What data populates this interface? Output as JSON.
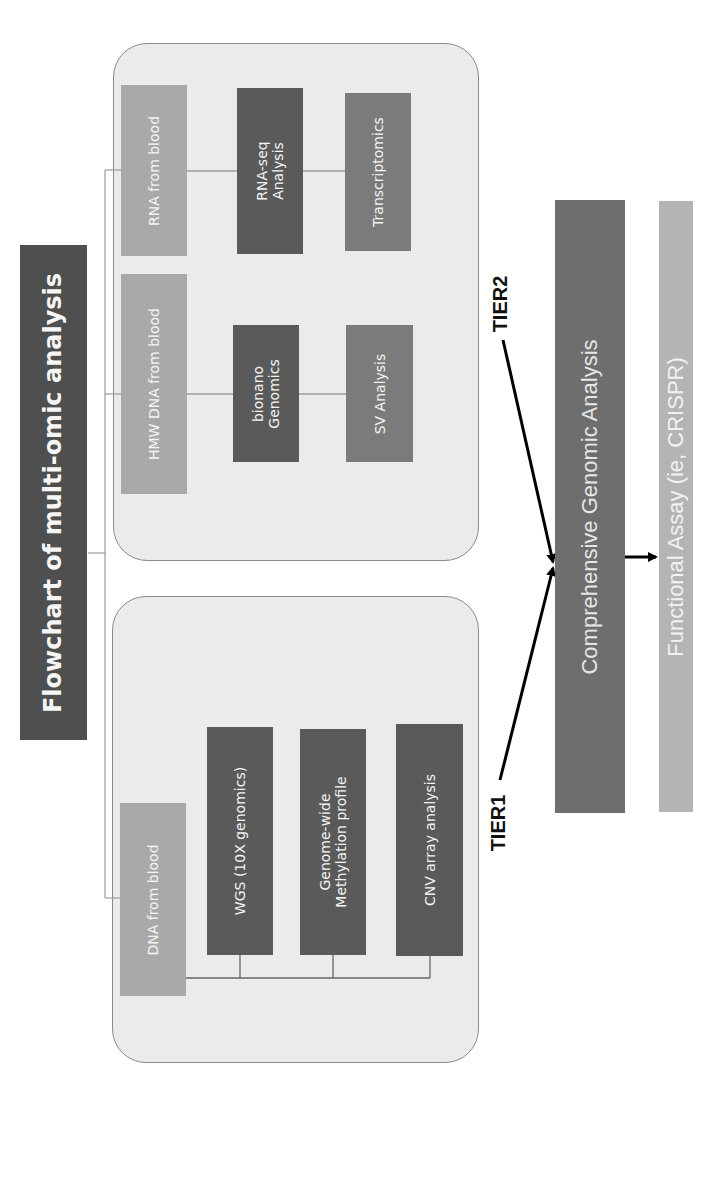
{
  "title": "Flowchart of multi-omic analysis",
  "tier2": {
    "label": "TIER2",
    "rows": [
      {
        "source": "RNA from blood",
        "steps": [
          "RNA-seq\nAnalysis",
          "Transcriptomics"
        ]
      },
      {
        "source": "HMW DNA from blood",
        "steps": [
          "bionano\nGenomics",
          "SV Analysis"
        ]
      }
    ]
  },
  "tier1": {
    "label": "TIER1",
    "source": "DNA from blood",
    "steps": [
      "WGS (10X genomics)",
      "Genome-wide\nMethylation profile",
      "CNV array analysis"
    ]
  },
  "outcome": {
    "integration": "Comprehensive Genomic Analysis",
    "functional": "Functional Assay (ie, CRISPR)"
  },
  "colors": {
    "title_bar": "#4f4f4f",
    "container_bg": "#ebebeb",
    "source_box": "#a9a9a9",
    "dark_box": "#5a5a5a",
    "mid_box": "#7b7b7b",
    "integration_bar": "#6e6e6e",
    "functional_bar": "#b4b4b4"
  }
}
